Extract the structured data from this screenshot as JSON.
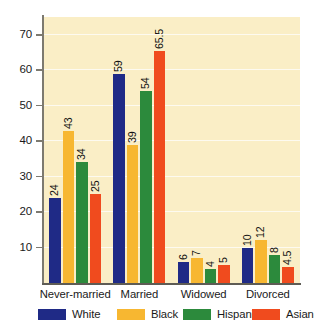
{
  "chart_data": {
    "type": "bar",
    "title": "",
    "subtitle": "",
    "xlabel": "",
    "ylabel": "",
    "categories": [
      "Never-married",
      "Married",
      "Widowed",
      "Divorced"
    ],
    "series": [
      {
        "name": "White",
        "color": "#1f2a86",
        "values": [
          24,
          59,
          6,
          10
        ]
      },
      {
        "name": "Black",
        "color": "#f7b731",
        "values": [
          43,
          39,
          7,
          12
        ]
      },
      {
        "name": "Hispanic",
        "color": "#2c8a3c",
        "values": [
          34,
          54,
          4,
          8
        ]
      },
      {
        "name": "Asian",
        "color": "#f04b1e",
        "values": [
          25,
          65.5,
          5,
          4.5
        ]
      }
    ],
    "value_labels": [
      [
        "24",
        "43",
        "34",
        "25"
      ],
      [
        "59",
        "39",
        "54",
        "65.5"
      ],
      [
        "6",
        "7",
        "4",
        "5"
      ],
      [
        "10",
        "12",
        "8",
        "4.5"
      ]
    ],
    "ylim": [
      0,
      75
    ],
    "yticks": [
      10,
      20,
      30,
      40,
      50,
      60,
      70
    ],
    "ytick_labels": [
      "10",
      "20",
      "30",
      "40",
      "50",
      "60",
      "70"
    ],
    "grid": true,
    "grid_color": "#fdfaf0",
    "plot_background": "#faeec6",
    "page_background": "#ffffff",
    "legend_position": "bottom"
  },
  "legend": {
    "entries": [
      {
        "label": "White",
        "color": "#1f2a86"
      },
      {
        "label": "Black",
        "color": "#f7b731"
      },
      {
        "label": "Hispanic",
        "color": "#2c8a3c"
      },
      {
        "label": "Asian",
        "color": "#f04b1e"
      }
    ]
  }
}
